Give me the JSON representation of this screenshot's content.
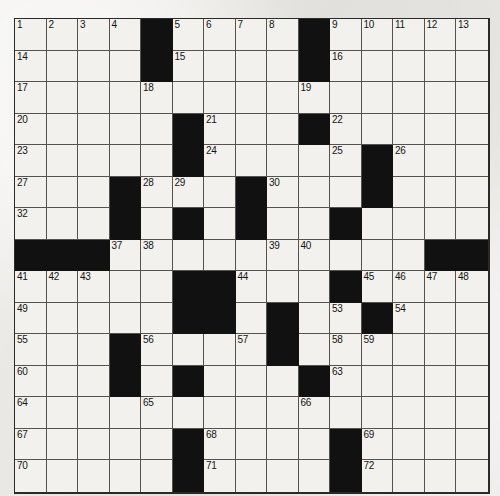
{
  "puzzle": {
    "kind": "crossword-grid",
    "rows": 15,
    "columns": 15,
    "cell_size_px": 31.5,
    "grid_left_px": 14,
    "grid_top_px": 18,
    "colors": {
      "page_background": "#ebeae6",
      "cell_fill": "#f2f1ee",
      "block_fill": "#111111",
      "grid_line": "#55534f",
      "outer_border": "#2a2a2a",
      "number_text": "#141414"
    },
    "legend": {
      "block_symbol": "#",
      "open_symbol": "."
    },
    "grid_rows": [
      "....#....#.....",
      "....#....#.....",
      "...............",
      ".....#...#.....",
      ".....#.....#...",
      "...#...#...#...",
      "...#.#.#..#....",
      "###..........##",
      ".....##...#....",
      ".....##.#..#...",
      "...#....#......",
      "...#.#...#.....",
      "...............",
      ".....#....#....",
      ".....#....#...."
    ],
    "numbers": [
      {
        "row": 0,
        "col": 0,
        "n": 1
      },
      {
        "row": 0,
        "col": 1,
        "n": 2
      },
      {
        "row": 0,
        "col": 2,
        "n": 3
      },
      {
        "row": 0,
        "col": 3,
        "n": 4
      },
      {
        "row": 0,
        "col": 5,
        "n": 5
      },
      {
        "row": 0,
        "col": 6,
        "n": 6
      },
      {
        "row": 0,
        "col": 7,
        "n": 7
      },
      {
        "row": 0,
        "col": 8,
        "n": 8
      },
      {
        "row": 0,
        "col": 10,
        "n": 9
      },
      {
        "row": 0,
        "col": 11,
        "n": 10
      },
      {
        "row": 0,
        "col": 12,
        "n": 11
      },
      {
        "row": 0,
        "col": 13,
        "n": 12
      },
      {
        "row": 0,
        "col": 14,
        "n": 13
      },
      {
        "row": 1,
        "col": 0,
        "n": 14
      },
      {
        "row": 1,
        "col": 5,
        "n": 15
      },
      {
        "row": 1,
        "col": 10,
        "n": 16
      },
      {
        "row": 2,
        "col": 0,
        "n": 17
      },
      {
        "row": 2,
        "col": 4,
        "n": 18
      },
      {
        "row": 2,
        "col": 9,
        "n": 19
      },
      {
        "row": 3,
        "col": 0,
        "n": 20
      },
      {
        "row": 3,
        "col": 6,
        "n": 21
      },
      {
        "row": 3,
        "col": 10,
        "n": 22
      },
      {
        "row": 4,
        "col": 0,
        "n": 23
      },
      {
        "row": 4,
        "col": 6,
        "n": 24
      },
      {
        "row": 4,
        "col": 10,
        "n": 25
      },
      {
        "row": 4,
        "col": 12,
        "n": 26
      },
      {
        "row": 5,
        "col": 0,
        "n": 27
      },
      {
        "row": 5,
        "col": 4,
        "n": 28
      },
      {
        "row": 5,
        "col": 5,
        "n": 29
      },
      {
        "row": 5,
        "col": 8,
        "n": 30
      },
      {
        "row": 5,
        "col": 11,
        "n": 31
      },
      {
        "row": 6,
        "col": 0,
        "n": 32
      },
      {
        "row": 6,
        "col": 3,
        "n": 33
      },
      {
        "row": 6,
        "col": 5,
        "n": 34
      },
      {
        "row": 6,
        "col": 7,
        "n": 35
      },
      {
        "row": 6,
        "col": 10,
        "n": 36
      },
      {
        "row": 7,
        "col": 3,
        "n": 37
      },
      {
        "row": 7,
        "col": 4,
        "n": 38
      },
      {
        "row": 7,
        "col": 8,
        "n": 39
      },
      {
        "row": 7,
        "col": 9,
        "n": 40
      },
      {
        "row": 8,
        "col": 0,
        "n": 41
      },
      {
        "row": 8,
        "col": 1,
        "n": 42
      },
      {
        "row": 8,
        "col": 2,
        "n": 43
      },
      {
        "row": 8,
        "col": 7,
        "n": 44
      },
      {
        "row": 8,
        "col": 11,
        "n": 45
      },
      {
        "row": 8,
        "col": 12,
        "n": 46
      },
      {
        "row": 8,
        "col": 13,
        "n": 47
      },
      {
        "row": 8,
        "col": 14,
        "n": 48
      },
      {
        "row": 9,
        "col": 0,
        "n": 49
      },
      {
        "row": 9,
        "col": 5,
        "n": 50
      },
      {
        "row": 9,
        "col": 6,
        "n": 51
      },
      {
        "row": 9,
        "col": 8,
        "n": 52
      },
      {
        "row": 9,
        "col": 10,
        "n": 53
      },
      {
        "row": 9,
        "col": 12,
        "n": 54
      },
      {
        "row": 10,
        "col": 0,
        "n": 55
      },
      {
        "row": 10,
        "col": 4,
        "n": 56
      },
      {
        "row": 10,
        "col": 7,
        "n": 57
      },
      {
        "row": 10,
        "col": 10,
        "n": 58
      },
      {
        "row": 10,
        "col": 11,
        "n": 59
      },
      {
        "row": 11,
        "col": 0,
        "n": 60
      },
      {
        "row": 11,
        "col": 3,
        "n": 61
      },
      {
        "row": 11,
        "col": 5,
        "n": 62
      },
      {
        "row": 11,
        "col": 10,
        "n": 63
      },
      {
        "row": 12,
        "col": 0,
        "n": 64
      },
      {
        "row": 12,
        "col": 4,
        "n": 65
      },
      {
        "row": 12,
        "col": 9,
        "n": 66
      },
      {
        "row": 13,
        "col": 0,
        "n": 67
      },
      {
        "row": 13,
        "col": 6,
        "n": 68
      },
      {
        "row": 13,
        "col": 11,
        "n": 69
      },
      {
        "row": 14,
        "col": 0,
        "n": 70
      },
      {
        "row": 14,
        "col": 6,
        "n": 71
      },
      {
        "row": 14,
        "col": 11,
        "n": 72
      }
    ]
  }
}
